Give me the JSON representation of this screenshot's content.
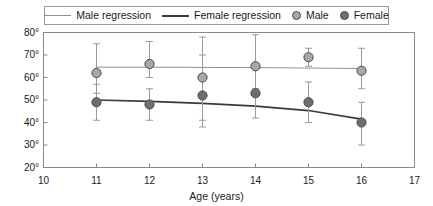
{
  "legend": {
    "entries": [
      {
        "label": "Male regression",
        "kind": "line",
        "icon": "line-swatch-light",
        "color": "#8d8d8d"
      },
      {
        "label": "Female regression",
        "kind": "line",
        "icon": "line-swatch-dark",
        "color": "#3a3a3a"
      },
      {
        "label": "Male",
        "kind": "marker",
        "icon": "circle-marker-light",
        "color": "#a8a8a8"
      },
      {
        "label": "Female",
        "kind": "marker",
        "icon": "circle-marker-dark",
        "color": "#6e6e6e"
      }
    ]
  },
  "axes": {
    "x": {
      "title": "Age (years)",
      "ticks": [
        "10",
        "11",
        "12",
        "13",
        "14",
        "15",
        "16",
        "17"
      ],
      "min": 10,
      "max": 17
    },
    "y": {
      "title": "",
      "ticks": [
        "20°",
        "30°",
        "40°",
        "50°",
        "60°",
        "70°",
        "80°"
      ],
      "min": 20,
      "max": 80
    }
  },
  "chart_data": {
    "type": "scatter",
    "title": "",
    "xlabel": "Age (years)",
    "ylabel": "",
    "xlim": [
      10,
      17
    ],
    "ylim": [
      20,
      80
    ],
    "grid": false,
    "legend_position": "top",
    "x": [
      11,
      12,
      13,
      14,
      15,
      16
    ],
    "series": [
      {
        "name": "Female",
        "marker": "circle",
        "color": "#a8a8a8",
        "values": [
          62,
          66,
          60,
          65,
          69,
          63
        ],
        "err_low": [
          53,
          60,
          41,
          55,
          65,
          55
        ],
        "err_high": [
          75,
          76,
          78,
          79,
          73,
          73
        ]
      },
      {
        "name": "Male",
        "marker": "circle",
        "color": "#6e6e6e",
        "values": [
          49,
          48,
          52,
          53,
          49,
          40
        ],
        "err_low": [
          41,
          41,
          38,
          42,
          40,
          30
        ],
        "err_high": [
          57,
          55,
          70,
          64,
          58,
          49
        ]
      }
    ],
    "regressions": [
      {
        "name": "Female regression",
        "color": "#8d8d8d",
        "width": 1,
        "points": [
          [
            11,
            64.6
          ],
          [
            12,
            64.6
          ],
          [
            13,
            64.5
          ],
          [
            14,
            64.4
          ],
          [
            15,
            64.2
          ],
          [
            16,
            64.0
          ]
        ]
      },
      {
        "name": "Male regression",
        "color": "#3a3a3a",
        "width": 1.6,
        "points": [
          [
            11,
            50.0
          ],
          [
            12,
            49.4
          ],
          [
            13,
            48.5
          ],
          [
            14,
            47.3
          ],
          [
            15,
            45.3
          ],
          [
            16,
            41.5
          ]
        ]
      }
    ]
  }
}
